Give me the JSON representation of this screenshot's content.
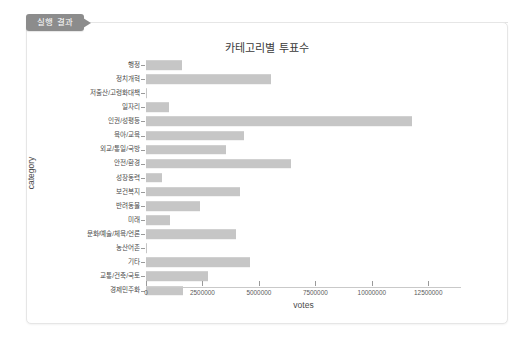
{
  "tab": {
    "label": "실행 결과"
  },
  "chart_data": {
    "type": "bar",
    "orientation": "horizontal",
    "title": "카테고리별 투표수",
    "xlabel": "votes",
    "ylabel": "category",
    "grid": false,
    "legend": null,
    "xlim": [
      0,
      13950000
    ],
    "xticks": [
      0,
      2500000,
      5000000,
      7500000,
      10000000,
      12500000
    ],
    "xtick_labels": [
      "0",
      "2500000",
      "5000000",
      "7500000",
      "10000000",
      "12500000"
    ],
    "bar_color": "#c6c6c6",
    "categories": [
      "행정",
      "정치개혁",
      "저출산/고령화대책",
      "일자리",
      "인권/성평등",
      "육아/교육",
      "외교/통일/국방",
      "안전/환경",
      "성장동력",
      "보건복지",
      "반려동물",
      "미래",
      "문화/예술/체육/언론",
      "농산어촌",
      "기타",
      "교통/건축/국토",
      "경제민주화"
    ],
    "values": [
      1600000,
      5550000,
      60000,
      1020000,
      11770000,
      4350000,
      3550000,
      6400000,
      700000,
      4170000,
      2400000,
      1060000,
      4000000,
      55000,
      4600000,
      2750000,
      1640000
    ]
  }
}
